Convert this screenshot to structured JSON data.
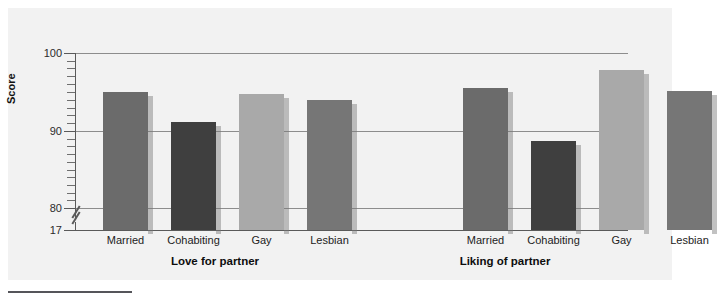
{
  "chart_data": {
    "type": "bar",
    "title": "",
    "xlabel": "",
    "ylabel": "Score",
    "ylim": [
      17,
      100
    ],
    "y_axis_break": true,
    "y_axis_break_between": [
      17,
      80
    ],
    "yticks": [
      "17",
      "80",
      "90",
      "100"
    ],
    "gridlines": [
      "80",
      "90",
      "100"
    ],
    "grid": true,
    "legend": "none",
    "groups": [
      {
        "label": "Love for partner",
        "categories": [
          "Married",
          "Cohabiting",
          "Gay",
          "Lesbian"
        ],
        "values": [
          95.0,
          91.2,
          94.7,
          94.0
        ]
      },
      {
        "label": "Liking of partner",
        "categories": [
          "Married",
          "Cohabiting",
          "Gay",
          "Lesbian"
        ],
        "values": [
          95.5,
          88.7,
          97.8,
          95.1
        ]
      }
    ],
    "bar_colors": [
      "#6b6b6b",
      "#3f3f3f",
      "#a9a9a9",
      "#767676"
    ],
    "colors": {
      "panel_background": "#f2f2f2",
      "gridline": "#8d8d8d",
      "axis": "#5a5a5a",
      "text": "#222222",
      "caption_rule": "#55555a"
    }
  }
}
